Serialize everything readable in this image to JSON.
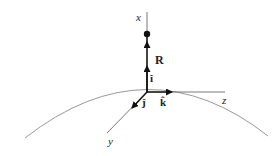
{
  "diagram": {
    "axes": {
      "x": "x",
      "y": "y",
      "z": "z"
    },
    "vector_label": "R",
    "unit_vectors": {
      "i": "î",
      "j": "ĵ",
      "k": "k̂"
    },
    "colors": {
      "axis": "#555555",
      "arrow": "#111111",
      "surface": "#999999"
    }
  }
}
